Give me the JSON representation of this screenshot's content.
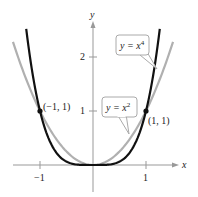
{
  "chart_data": {
    "type": "line",
    "title": "",
    "xlabel": "x",
    "ylabel": "y",
    "x_ticks": [
      {
        "value": -1,
        "label": "−1"
      },
      {
        "value": 1,
        "label": "1"
      }
    ],
    "y_ticks": [
      {
        "value": 1,
        "label": "1"
      },
      {
        "value": 2,
        "label": "2"
      }
    ],
    "xlim": [
      -1.5,
      1.6
    ],
    "ylim": [
      -0.45,
      2.65
    ],
    "grid": false,
    "legend": "none (callout labels)",
    "series": [
      {
        "name": "y = x^4",
        "label_main": "y = x",
        "label_exp": "4",
        "color": "#111111",
        "function": "x^4",
        "x_range": [
          -1.26,
          1.26
        ]
      },
      {
        "name": "y = x^2",
        "label_main": "y = x",
        "label_exp": "2",
        "color": "#b0b0b0",
        "function": "x^2",
        "x_range": [
          -1.51,
          1.51
        ]
      }
    ],
    "points": [
      {
        "x": -1,
        "y": 1,
        "label": "(−1, 1)"
      },
      {
        "x": 1,
        "y": 1,
        "label": "(1, 1)"
      }
    ]
  }
}
